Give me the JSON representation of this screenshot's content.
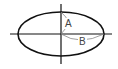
{
  "diagram": {
    "type": "ellipse-with-axes",
    "labels": {
      "a": "A",
      "b": "B"
    },
    "colors": {
      "stroke": "#111111",
      "arc": "#888888",
      "label": "#444444",
      "background": "#ffffff"
    }
  }
}
